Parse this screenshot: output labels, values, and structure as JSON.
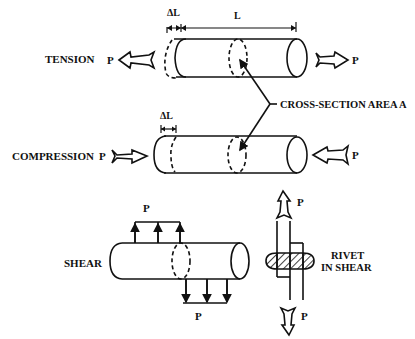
{
  "diagram": {
    "labels": {
      "tension": "TENSION",
      "compression": "COMPRESSION",
      "shear": "SHEAR",
      "cross_section": "CROSS-SECTION AREA A",
      "rivet_line1": "RIVET",
      "rivet_line2": "IN SHEAR",
      "load": "P",
      "length": "L",
      "delta_length": "ΔL"
    },
    "panels": [
      {
        "name": "tension",
        "label": "TENSION",
        "force": "P",
        "direction": "outward"
      },
      {
        "name": "compression",
        "label": "COMPRESSION",
        "force": "P",
        "direction": "inward"
      },
      {
        "name": "shear",
        "label": "SHEAR",
        "force": "P",
        "direction": "transverse"
      },
      {
        "name": "rivet-in-shear",
        "label": "RIVET IN SHEAR",
        "force": "P",
        "direction": "axial-opposed"
      }
    ],
    "colors": {
      "ink": "#111111",
      "background": "#ffffff"
    }
  }
}
